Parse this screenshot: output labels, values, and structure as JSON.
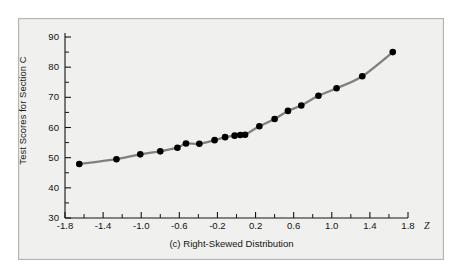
{
  "figure": {
    "background_color": "#ffffff",
    "plate_color": "#f0f0ee",
    "plate_border_color": "#b4b4b0",
    "caption": "(c) Right-Skewed Distribution",
    "axis_color": "#141414",
    "marker_color": "#000000",
    "line_color": "#808080"
  },
  "chart_data": {
    "type": "scatter",
    "title": "",
    "subtitle": "",
    "caption": "(c) Right-Skewed Distribution",
    "xlabel": "Z",
    "ylabel": "Test Scores for Section C",
    "xlim": [
      -1.8,
      1.8
    ],
    "ylim": [
      30,
      90
    ],
    "grid": false,
    "legend": false,
    "x_ticks": [
      -1.8,
      -1.4,
      -1.0,
      -0.6,
      -0.2,
      0.2,
      0.6,
      1.0,
      1.4,
      1.8
    ],
    "x_tick_labels": [
      "-1.8",
      "-1.4",
      "-1.0",
      "-0.6",
      "-0.2",
      "0.2",
      "0.6",
      "1.0",
      "1.4",
      "1.8"
    ],
    "x_minor_ticks": [
      -1.6,
      -1.2,
      -0.8,
      -0.4,
      0.0,
      0.4,
      0.8,
      1.2,
      1.6
    ],
    "y_ticks": [
      30,
      40,
      50,
      60,
      70,
      80,
      90
    ],
    "y_tick_labels": [
      "30",
      "40",
      "50",
      "60",
      "70",
      "80",
      "90"
    ],
    "y_minor_ticks": [
      35,
      45,
      55,
      65,
      75,
      85
    ],
    "series": [
      {
        "name": "Section C scores",
        "marker": "filled-circle",
        "connected": true,
        "x": [
          -1.65,
          -1.26,
          -1.01,
          -0.8,
          -0.62,
          -0.53,
          -0.39,
          -0.23,
          -0.12,
          -0.02,
          0.04,
          0.09,
          0.24,
          0.4,
          0.54,
          0.68,
          0.86,
          1.05,
          1.32,
          1.64
        ],
        "y": [
          47.9,
          49.5,
          51.1,
          52.1,
          53.3,
          54.7,
          54.6,
          55.8,
          56.8,
          57.3,
          57.5,
          57.6,
          60.4,
          62.8,
          65.5,
          67.3,
          70.5,
          73.0,
          77.0,
          85.0
        ]
      }
    ]
  },
  "axes": {
    "y_axis_title": "Test Scores for Section C",
    "x_axis_symbol": "Z"
  }
}
